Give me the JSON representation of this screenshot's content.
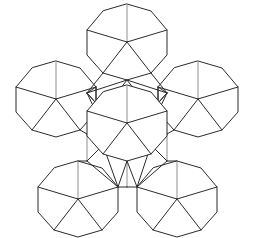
{
  "figure": {
    "name": "polyhedron-net",
    "background_color": "#ffffff",
    "stroke_color": "#2b2b2b",
    "stroke_color_light": "#8f8f8f",
    "stroke_width": 1,
    "width": 253,
    "height": 238
  },
  "chart_data": {
    "type": "diagram",
    "title": "",
    "grid": false,
    "legend": null,
    "xlim": [
      0,
      253
    ],
    "ylim": [
      0,
      238
    ],
    "decagon_count": 6,
    "decagons": [
      {
        "id": "top",
        "cx": 127,
        "cy": 42,
        "r": 40,
        "rotation": 0
      },
      {
        "id": "upper-left",
        "cx": 56,
        "cy": 99,
        "r": 40,
        "rotation": 0
      },
      {
        "id": "upper-right",
        "cx": 198,
        "cy": 99,
        "r": 40,
        "rotation": 0
      },
      {
        "id": "center",
        "cx": 127,
        "cy": 123,
        "r": 40,
        "rotation": 0
      },
      {
        "id": "lower-left",
        "cx": 78,
        "cy": 199,
        "r": 40,
        "rotation": 0
      },
      {
        "id": "lower-right",
        "cx": 177,
        "cy": 199,
        "r": 40,
        "rotation": 0
      }
    ],
    "interior_pattern": "each decagon contains a pentagon of radial spokes from its center to five alternating vertices, forming five internal triangles",
    "connector_faces": "triangular faces link adjacent decagons across the net"
  }
}
